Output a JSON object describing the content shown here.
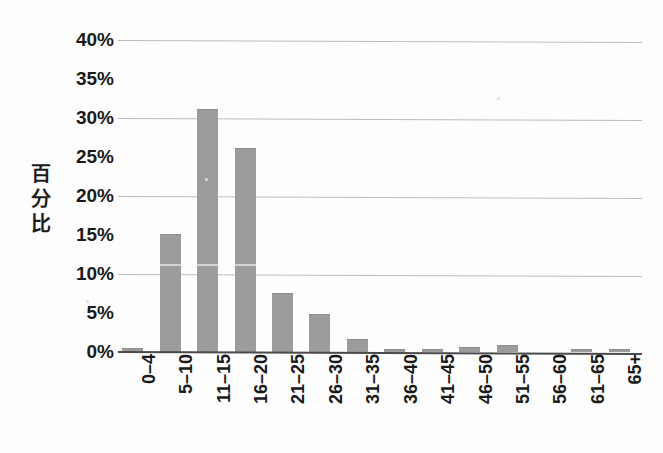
{
  "chart_data": {
    "type": "bar",
    "title": "",
    "xlabel": "",
    "ylabel": "百分比",
    "ylim": [
      0,
      40
    ],
    "ytick_labels": [
      "40%",
      "35%",
      "30%",
      "25%",
      "20%",
      "15%",
      "10%",
      "5%",
      "0%"
    ],
    "ytick_values": [
      40,
      35,
      30,
      25,
      20,
      15,
      10,
      5,
      0
    ],
    "gridlines_at": [
      40,
      30,
      20,
      10
    ],
    "grid": true,
    "legend": "none",
    "bar_color": "#9c9c9c",
    "categories": [
      "0–4",
      "5–10",
      "11–15",
      "16–20",
      "21–25",
      "26–30",
      "31–35",
      "36–40",
      "41–45",
      "46–50",
      "51–55",
      "56–60",
      "61–65",
      "65+"
    ],
    "values": [
      0.4,
      15.0,
      31.0,
      26.0,
      7.5,
      4.8,
      1.5,
      0.3,
      0.3,
      0.5,
      0.8,
      0.0,
      0.3,
      0.3
    ],
    "unit": "%"
  },
  "axis": {
    "y_title_chars": "百\n分\n比",
    "y_title_text": "百分比"
  },
  "colors": {
    "bar": "#9c9c9c",
    "gridline": "#b9bcc0",
    "axis": "#4a4a4a",
    "text": "#1a1a1a",
    "background": "#fdfdfd"
  }
}
